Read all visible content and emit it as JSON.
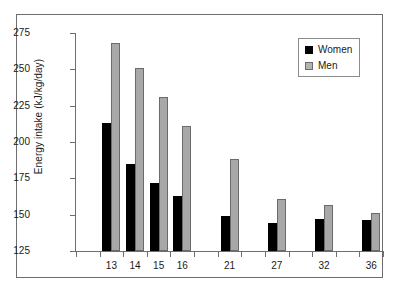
{
  "figure": {
    "caption_partial": "",
    "background": "#ffffff",
    "frame_color": "#6e6e6e"
  },
  "legend": {
    "position": "top-right",
    "entries": [
      {
        "label": "Women",
        "color": "#000000"
      },
      {
        "label": "Men",
        "color": "#a8a8a8"
      }
    ]
  },
  "chart_data": {
    "type": "bar",
    "title": "",
    "subtitle": "",
    "xlabel": "",
    "ylabel": "Energy intake (kJ/kg/day)",
    "categories": [
      "13",
      "14",
      "15",
      "16",
      "21",
      "27",
      "32",
      "36"
    ],
    "slots": [
      1,
      2,
      3,
      4,
      6,
      8,
      10,
      12
    ],
    "slot_count": 13,
    "series": [
      {
        "name": "Women",
        "color": "#000000",
        "values": [
          213,
          185,
          172,
          163,
          149,
          144,
          147,
          146
        ]
      },
      {
        "name": "Men",
        "color": "#a8a8a8",
        "values": [
          268,
          251,
          231,
          211,
          188,
          161,
          157,
          151
        ]
      }
    ],
    "ylim": [
      125,
      275
    ],
    "yticks": [
      125,
      150,
      175,
      200,
      225,
      250,
      275
    ],
    "ytick_labels": [
      "125",
      "150",
      "175",
      "200",
      "225",
      "250",
      "275"
    ],
    "grid": false,
    "legend_position": "upper right"
  }
}
